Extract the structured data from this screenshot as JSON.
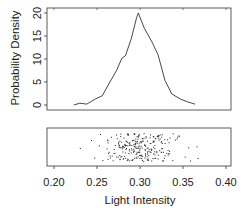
{
  "chart_data": [
    {
      "type": "line",
      "panel": "top",
      "title": "",
      "xlabel": "",
      "ylabel": "Probability Density",
      "ylim": [
        0,
        20
      ],
      "xlim": [
        0.2,
        0.4
      ],
      "yticks": [
        "0",
        "5",
        "10",
        "15",
        "20"
      ],
      "grid": false,
      "series": [
        {
          "name": "density",
          "x": [
            0.223,
            0.23,
            0.238,
            0.248,
            0.256,
            0.265,
            0.273,
            0.279,
            0.283,
            0.29,
            0.296,
            0.298,
            0.305,
            0.314,
            0.321,
            0.329,
            0.337,
            0.347,
            0.355,
            0.364
          ],
          "y": [
            0.0,
            0.4,
            0.2,
            1.3,
            2.0,
            5.0,
            7.6,
            10.2,
            10.7,
            14.5,
            19.0,
            20.0,
            16.7,
            13.7,
            10.9,
            5.4,
            2.4,
            1.3,
            0.7,
            0.2
          ]
        }
      ]
    },
    {
      "type": "scatter",
      "panel": "bottom",
      "title": "",
      "xlabel": "Light Intensity",
      "ylabel": "",
      "xlim": [
        0.2,
        0.4
      ],
      "xticks": [
        "0.20",
        "0.25",
        "0.30",
        "0.35",
        "0.40"
      ],
      "note": "1-D jittered strip chart of observations, concentrated between 0.25 and 0.35, centered near 0.30; range approx 0.23 to 0.367",
      "range": [
        0.23,
        0.367
      ],
      "center": 0.3
    }
  ],
  "axes": {
    "ylabel": "Probability Density",
    "xlabel": "Light Intensity",
    "yticks": [
      "0",
      "5",
      "10",
      "15",
      "20"
    ],
    "xticks": [
      "0.20",
      "0.25",
      "0.30",
      "0.35",
      "0.40"
    ]
  }
}
